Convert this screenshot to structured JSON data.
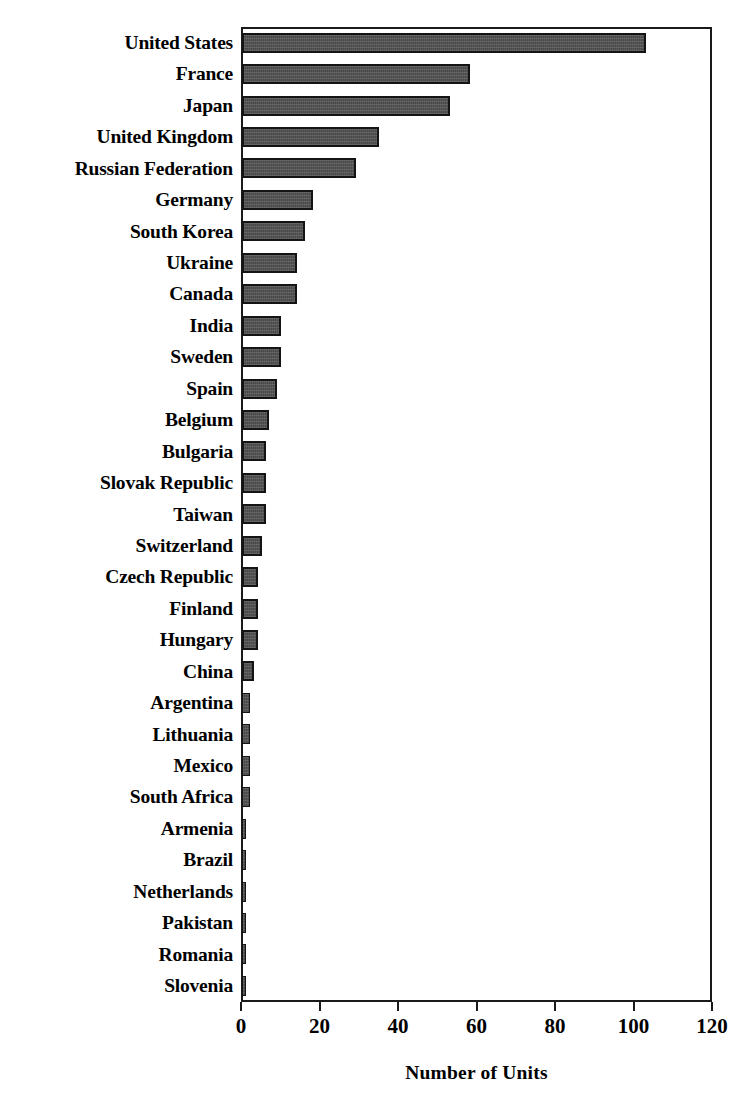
{
  "chart_data": {
    "type": "bar",
    "orientation": "horizontal",
    "title": "",
    "xlabel": "Number of Units",
    "ylabel": "",
    "xlim": [
      0,
      120
    ],
    "xticks": [
      0,
      20,
      40,
      60,
      80,
      100,
      120
    ],
    "grid": false,
    "legend": null,
    "bar_color": "#4a4a4a",
    "bar_edge_color": "#141414",
    "background_color": "#ffffff",
    "categories": [
      "United States",
      "France",
      "Japan",
      "United Kingdom",
      "Russian Federation",
      "Germany",
      "South Korea",
      "Ukraine",
      "Canada",
      "India",
      "Sweden",
      "Spain",
      "Belgium",
      "Bulgaria",
      "Slovak Republic",
      "Taiwan",
      "Switzerland",
      "Czech Republic",
      "Finland",
      "Hungary",
      "China",
      "Argentina",
      "Lithuania",
      "Mexico",
      "South Africa",
      "Armenia",
      "Brazil",
      "Netherlands",
      "Pakistan",
      "Romania",
      "Slovenia"
    ],
    "values": [
      103,
      58,
      53,
      35,
      29,
      18,
      16,
      14,
      14,
      10,
      10,
      9,
      7,
      6,
      6,
      6,
      5,
      4,
      4,
      4,
      3,
      2,
      2,
      2,
      2,
      1,
      1,
      1,
      1,
      1,
      1
    ]
  }
}
